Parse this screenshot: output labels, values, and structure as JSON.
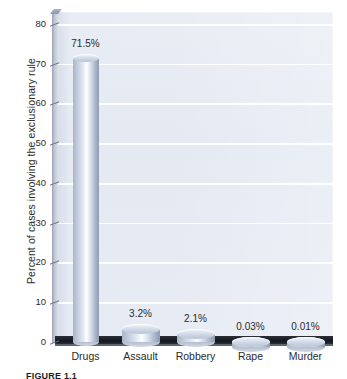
{
  "chart_data": {
    "type": "bar",
    "title": "",
    "subtitle": "",
    "xlabel": "",
    "ylabel": "Percent of cases involving the exclusionary rule",
    "categories": [
      "Drugs",
      "Assault",
      "Robbery",
      "Rape",
      "Murder"
    ],
    "values": [
      71.5,
      3.2,
      2.1,
      0.03,
      0.01
    ],
    "data_labels": [
      "71.5%",
      "3.2%",
      "2.1%",
      "0.03%",
      "0.01%"
    ],
    "ylim": [
      0,
      83
    ],
    "ytick_values": [
      0,
      10,
      20,
      30,
      40,
      50,
      60,
      70,
      80
    ],
    "ytick_labels": [
      "0",
      "10",
      "20",
      "30",
      "40",
      "50",
      "60",
      "70",
      "80"
    ],
    "grid": true,
    "grid_axis": "y",
    "grid_color": "#ffffff",
    "legend": "none",
    "series": [
      {
        "name": "Percent of cases involving the exclusionary rule",
        "values": [
          71.5,
          3.2,
          2.1,
          0.03,
          0.01
        ]
      }
    ],
    "style": {
      "bar_style": "3d-cylinder",
      "plot_background": "#e6eaf2",
      "bar_fill_light": "#ffffff",
      "bar_fill_mid": "#c3cddd",
      "bar_fill_dark": "#8e9bb1",
      "floor_color": "#14171d",
      "axis_color": "#6a7080",
      "text_color": "#2b2b2b"
    }
  },
  "figure": {
    "caption": "FIGURE 1.1"
  }
}
